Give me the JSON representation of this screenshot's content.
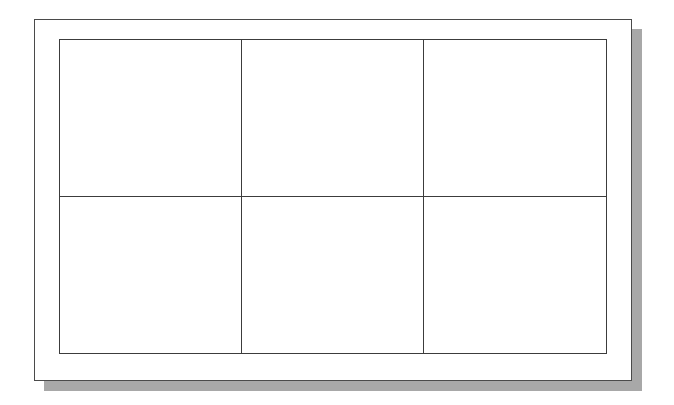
{
  "diagram": {
    "type": "grid-table",
    "rows": 2,
    "columns": 3,
    "cells": [
      [
        "",
        "",
        ""
      ],
      [
        "",
        "",
        ""
      ]
    ],
    "style": {
      "line_color": "#3c3c3c",
      "frame_color": "#4a4a4a",
      "shadow_color": "#a8a8a8",
      "background": "#ffffff"
    }
  }
}
